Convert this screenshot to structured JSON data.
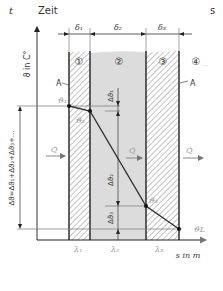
{
  "header": {
    "symbol": "t",
    "label": "Zeit",
    "unit": "s"
  },
  "axes": {
    "y_label": "ϑ in C°",
    "x_label": "s in m"
  },
  "thickness_labels": [
    "δ₁",
    "δ₂",
    "δ₃"
  ],
  "layer_numbers": [
    "①",
    "②",
    "③",
    "④"
  ],
  "layer_4_suffix": "...",
  "surface_marker": "A",
  "conductivity_labels": [
    "λ₁",
    "λ₂",
    "λ₃"
  ],
  "temperatures": {
    "t1": "ϑ₁",
    "t2": "ϑ₂",
    "t3": "ϑ₃",
    "tL": "ϑL"
  },
  "heat_flow_label": "Q̇",
  "delta_labels": {
    "d1": "Δϑ₁",
    "d2": "Δϑ₂",
    "d3": "Δϑ₃",
    "total": "Δϑ=Δϑ₁+Δϑ₂+Δϑ₃+..."
  },
  "colors": {
    "line": "#222222",
    "gray_fill": "#dcdcdc",
    "hatch": "#555555",
    "label_light": "#9a9a9a"
  }
}
